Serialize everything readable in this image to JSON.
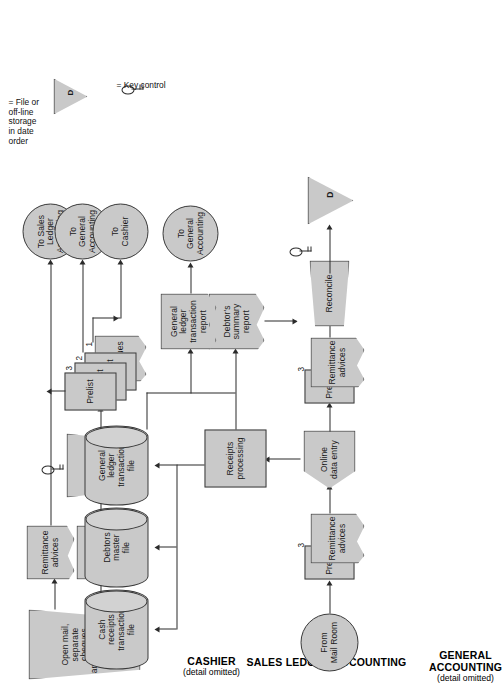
{
  "diagram": {
    "fill_color": "#c9c9c9",
    "stroke_color": "#3a3a3a",
    "background": "#ffffff"
  },
  "lanes": [
    {
      "id": "general-accounting",
      "title": "GENERAL\nACCOUNTING",
      "title_line1": "GENERAL",
      "title_line2": "ACCOUNTING",
      "subtitle": "(detail omitted)"
    },
    {
      "id": "sales-ledger-accounting",
      "title": "SALES LEDGER ACCOUNTING",
      "subtitle": ""
    },
    {
      "id": "cashier",
      "title": "CASHIER",
      "subtitle": "(detail omitted)"
    },
    {
      "id": "mail-room",
      "title": "MAIL ROOM",
      "subtitle": ""
    }
  ],
  "mail_room": {
    "open_mail": "Open mail,\nseparate cheques\nand remittance\nadvices",
    "remittance_advices": "Remittance\nadvices",
    "cheques": "Cheques",
    "prepare_prelist": "Prepare prelist\nin triplicate\nand . . .",
    "prelist_3": "Prelist",
    "prelist_2": "Prelist",
    "prelist_1": "Prelist",
    "cheques_stack": "Cheques",
    "copy_3": "3",
    "copy_2": "2",
    "copy_1": "1",
    "to_sales_ledger": "To Sales\nLedger\nAccounting",
    "to_general_accounting": "To\nGeneral\nAccounting",
    "to_cashier": "To\nCashier"
  },
  "sales_ledger": {
    "from_mail_room": "From\nMail Room",
    "prelist_in": "Prelist",
    "copy_3_in": "3",
    "remittance_advices_in": "Remittance\nadvices",
    "online_data_entry": "Online\ndata entry",
    "prelist_out": "Prelist",
    "copy_3_out": "3",
    "remittance_advices_out": "Remittance\nadvices",
    "receipts_processing": "Receipts\nprocessing",
    "reconcile": "Reconcile",
    "debtors_summary_report": "Debtor's\nsummary report",
    "general_ledger_transaction_report": "General ledger\ntransaction report",
    "file_d": "D",
    "to_general_accounting": "To\nGeneral\nAccounting",
    "cash_receipts_transaction_file": "Cash\nreceipts\ntransaction\nfile",
    "debtors_master_file": "Debtors\nmaster\nfile",
    "general_ledger_transaction_file": "General\nledger\ntransaction\nfile"
  },
  "legend": {
    "file_symbol": "D",
    "file_text": "= File or\noff-line\nstorage\nin date\norder",
    "key_control_text": "= Key control"
  }
}
